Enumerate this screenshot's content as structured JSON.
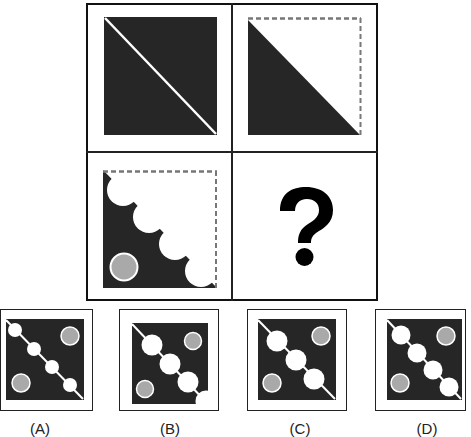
{
  "puzzle": {
    "cells": [
      {
        "id": "top-left",
        "description": "dark square with white diagonal line"
      },
      {
        "id": "top-right",
        "description": "dark lower-left triangle, white upper-right with dashed border"
      },
      {
        "id": "bottom-left",
        "description": "dark square with white scalloped circles along diagonal and gray circle"
      },
      {
        "id": "bottom-right",
        "description": "question mark",
        "text": "?"
      }
    ]
  },
  "options": [
    {
      "id": "A",
      "label": "(A)"
    },
    {
      "id": "B",
      "label": "(B)"
    },
    {
      "id": "C",
      "label": "(C)"
    },
    {
      "id": "D",
      "label": "(D)"
    }
  ],
  "colors": {
    "dark": "#262626",
    "white": "#ffffff",
    "gray_circle": "#a9a9a9",
    "dashed_border": "#777777",
    "frame": "#111111"
  }
}
